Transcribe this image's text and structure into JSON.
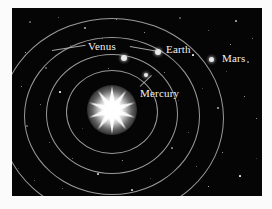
{
  "figure": {
    "background_color": "#050505",
    "page_color": "#fbfbfb",
    "orbit_color": "#9a9a9a",
    "label_color": "#f2f2f2",
    "planet_color": "#e8e8e8",
    "sun_color": "#ffffff"
  },
  "sun": {
    "name": "Sun",
    "center_x": 100,
    "center_y": 102,
    "ray_count": 10
  },
  "orbits": [
    {
      "name": "mercury-orbit",
      "cx": 100,
      "cy": 104,
      "rx": 46,
      "ry": 42
    },
    {
      "name": "venus-orbit",
      "cx": 100,
      "cy": 106,
      "rx": 66,
      "ry": 60
    },
    {
      "name": "earth-orbit",
      "cx": 100,
      "cy": 108,
      "rx": 88,
      "ry": 79
    },
    {
      "name": "mars-orbit",
      "cx": 100,
      "cy": 110,
      "rx": 112,
      "ry": 100
    }
  ],
  "planets": [
    {
      "name": "Mercury",
      "x": 134,
      "y": 67,
      "size": 4
    },
    {
      "name": "Venus",
      "x": 112,
      "y": 50,
      "size": 6
    },
    {
      "name": "Earth",
      "x": 146,
      "y": 44,
      "size": 6
    },
    {
      "name": "Mars",
      "x": 199,
      "y": 51,
      "size": 5
    }
  ],
  "labels": [
    {
      "name": "Venus",
      "x": 76,
      "y": 32,
      "font_size": 11
    },
    {
      "name": "Earth",
      "x": 154,
      "y": 35,
      "font_size": 11
    },
    {
      "name": "Mars",
      "x": 210,
      "y": 44,
      "font_size": 11
    },
    {
      "name": "Mercury",
      "x": 128,
      "y": 79,
      "font_size": 11
    }
  ],
  "leaders": [
    {
      "name": "venus-leader-left",
      "x": 40,
      "y": 42,
      "length": 34,
      "angle": -9
    },
    {
      "name": "venus-leader-right",
      "x": 118,
      "y": 38,
      "length": 26,
      "angle": 10
    },
    {
      "name": "mercury-leader",
      "x": 128,
      "y": 78,
      "length": 16,
      "angle": -44
    }
  ],
  "stars": [
    {
      "x": 18,
      "y": 14,
      "s": 1.2
    },
    {
      "x": 46,
      "y": 9,
      "s": 1.0
    },
    {
      "x": 73,
      "y": 20,
      "s": 1.4
    },
    {
      "x": 104,
      "y": 11,
      "s": 1.0
    },
    {
      "x": 132,
      "y": 24,
      "s": 0.9
    },
    {
      "x": 168,
      "y": 10,
      "s": 1.3
    },
    {
      "x": 196,
      "y": 22,
      "s": 1.0
    },
    {
      "x": 224,
      "y": 13,
      "s": 1.1
    },
    {
      "x": 240,
      "y": 30,
      "s": 0.9
    },
    {
      "x": 13,
      "y": 44,
      "s": 1.0
    },
    {
      "x": 34,
      "y": 60,
      "s": 1.2
    },
    {
      "x": 58,
      "y": 37,
      "s": 0.9
    },
    {
      "x": 90,
      "y": 30,
      "s": 1.0
    },
    {
      "x": 152,
      "y": 64,
      "s": 0.9
    },
    {
      "x": 181,
      "y": 47,
      "s": 1.1
    },
    {
      "x": 214,
      "y": 63,
      "s": 1.0
    },
    {
      "x": 236,
      "y": 54,
      "s": 1.2
    },
    {
      "x": 9,
      "y": 78,
      "s": 1.0
    },
    {
      "x": 28,
      "y": 96,
      "s": 0.9
    },
    {
      "x": 48,
      "y": 84,
      "s": 1.1
    },
    {
      "x": 166,
      "y": 92,
      "s": 1.0
    },
    {
      "x": 190,
      "y": 80,
      "s": 0.9
    },
    {
      "x": 206,
      "y": 100,
      "s": 1.3
    },
    {
      "x": 232,
      "y": 88,
      "s": 1.0
    },
    {
      "x": 244,
      "y": 110,
      "s": 0.9
    },
    {
      "x": 15,
      "y": 118,
      "s": 1.1
    },
    {
      "x": 37,
      "y": 134,
      "s": 1.0
    },
    {
      "x": 60,
      "y": 150,
      "s": 0.9
    },
    {
      "x": 86,
      "y": 166,
      "s": 1.2
    },
    {
      "x": 110,
      "y": 152,
      "s": 0.9
    },
    {
      "x": 138,
      "y": 170,
      "s": 1.0
    },
    {
      "x": 160,
      "y": 140,
      "s": 1.1
    },
    {
      "x": 184,
      "y": 158,
      "s": 0.9
    },
    {
      "x": 210,
      "y": 144,
      "s": 1.0
    },
    {
      "x": 228,
      "y": 168,
      "s": 1.2
    },
    {
      "x": 244,
      "y": 150,
      "s": 0.9
    },
    {
      "x": 22,
      "y": 172,
      "s": 1.0
    },
    {
      "x": 50,
      "y": 180,
      "s": 0.9
    },
    {
      "x": 120,
      "y": 182,
      "s": 1.1
    },
    {
      "x": 196,
      "y": 178,
      "s": 1.0
    },
    {
      "x": 70,
      "y": 120,
      "s": 0.8
    },
    {
      "x": 176,
      "y": 124,
      "s": 0.8
    },
    {
      "x": 128,
      "y": 136,
      "s": 0.8
    },
    {
      "x": 96,
      "y": 60,
      "s": 0.8
    },
    {
      "x": 218,
      "y": 36,
      "s": 0.8
    },
    {
      "x": 6,
      "y": 160,
      "s": 0.8
    }
  ]
}
